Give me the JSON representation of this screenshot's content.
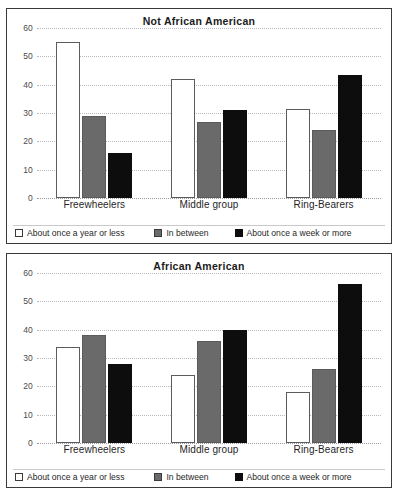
{
  "chart_data": [
    {
      "type": "bar",
      "title": "Not African American",
      "xlabel": "",
      "ylabel": "",
      "ylim": [
        0,
        60
      ],
      "yticks": [
        0,
        10,
        20,
        30,
        40,
        50,
        60
      ],
      "grid": true,
      "legend_position": "bottom",
      "categories": [
        "Freewheelers",
        "Middle group",
        "Ring-Bearers"
      ],
      "series": [
        {
          "name": "About once a year or less",
          "color": "#ffffff",
          "values": [
            55,
            42,
            31.5
          ]
        },
        {
          "name": "In between",
          "color": "#6a6a6a",
          "values": [
            29,
            27,
            24
          ]
        },
        {
          "name": "About once a week or more",
          "color": "#0d0d0d",
          "values": [
            16,
            31,
            43.5
          ]
        }
      ]
    },
    {
      "type": "bar",
      "title": "African American",
      "xlabel": "",
      "ylabel": "",
      "ylim": [
        0,
        60
      ],
      "yticks": [
        0,
        10,
        20,
        30,
        40,
        50,
        60
      ],
      "grid": true,
      "legend_position": "bottom",
      "categories": [
        "Freewheelers",
        "Middle group",
        "Ring-Bearers"
      ],
      "series": [
        {
          "name": "About once a year or less",
          "color": "#ffffff",
          "values": [
            34,
            24,
            18
          ]
        },
        {
          "name": "In between",
          "color": "#6a6a6a",
          "values": [
            38,
            36,
            26
          ]
        },
        {
          "name": "About once a week or more",
          "color": "#0d0d0d",
          "values": [
            28,
            40,
            56
          ]
        }
      ]
    }
  ],
  "panels": [
    {
      "title": "Not African American",
      "yticks": [
        "60",
        "50",
        "40",
        "30",
        "20",
        "10",
        "0"
      ],
      "categories": [
        "Freewheelers",
        "Middle group",
        "Ring-Bearers"
      ],
      "legend": [
        "About once a year or less",
        "In between",
        "About once a week or more"
      ]
    },
    {
      "title": "African American",
      "yticks": [
        "60",
        "50",
        "40",
        "30",
        "20",
        "10",
        "0"
      ],
      "categories": [
        "Freewheelers",
        "Middle group",
        "Ring-Bearers"
      ],
      "legend": [
        "About once a year or less",
        "In between",
        "About once a week or more"
      ]
    }
  ],
  "colors": {
    "series_once_a_year_or_less": "#ffffff",
    "series_in_between": "#6a6a6a",
    "series_once_a_week_or_more": "#0d0d0d",
    "gridline": "#b9b9c4",
    "frame": "#3a3a3a",
    "text": "#1f1f1f"
  }
}
